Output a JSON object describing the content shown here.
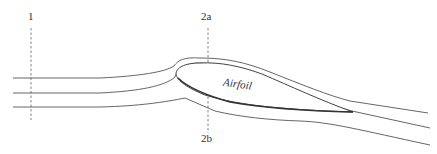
{
  "diagram": {
    "type": "streamlines around an airfoil",
    "labels": {
      "station_1": "1",
      "station_2a": "2a",
      "station_2b": "2b",
      "airfoil": "Airfoil"
    },
    "stations": [
      {
        "id": "1",
        "x": 31,
        "y_top": 28,
        "y_bottom": 120
      },
      {
        "id": "2a",
        "x": 208,
        "y_top": 28,
        "y_bottom": 62
      },
      {
        "id": "2b",
        "x": 208,
        "y_top": 92,
        "y_bottom": 132
      }
    ],
    "streamline_count": 3
  }
}
